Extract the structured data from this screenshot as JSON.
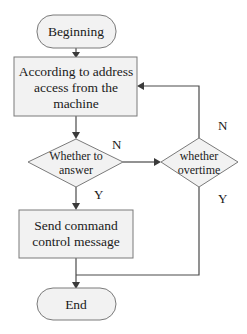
{
  "diagram": {
    "type": "flowchart",
    "nodes": {
      "start": {
        "kind": "terminal",
        "label": "Beginning"
      },
      "access": {
        "kind": "process",
        "lines": [
          "According to address",
          "access from the",
          "machine"
        ]
      },
      "answer": {
        "kind": "decision",
        "lines": [
          "Whether to",
          "answer"
        ]
      },
      "overtime": {
        "kind": "decision",
        "lines": [
          "whether",
          "overtime"
        ]
      },
      "send": {
        "kind": "process",
        "lines": [
          "Send command",
          "control message"
        ]
      },
      "end": {
        "kind": "terminal",
        "label": "End"
      }
    },
    "edge_labels": {
      "answer_no": "N",
      "answer_yes": "Y",
      "overtime_no": "N",
      "overtime_yes": "Y"
    },
    "edges": [
      {
        "from": "start",
        "to": "access"
      },
      {
        "from": "access",
        "to": "answer"
      },
      {
        "from": "answer",
        "to": "overtime",
        "label": "N"
      },
      {
        "from": "answer",
        "to": "send",
        "label": "Y"
      },
      {
        "from": "overtime",
        "to": "access",
        "label": "N"
      },
      {
        "from": "overtime",
        "to": "end",
        "label": "Y"
      },
      {
        "from": "send",
        "to": "end"
      }
    ],
    "colors": {
      "fill": "#f2f2f2",
      "stroke": "#7a7a7a",
      "line": "#4a4a4a",
      "text": "#1a1a1a"
    }
  }
}
